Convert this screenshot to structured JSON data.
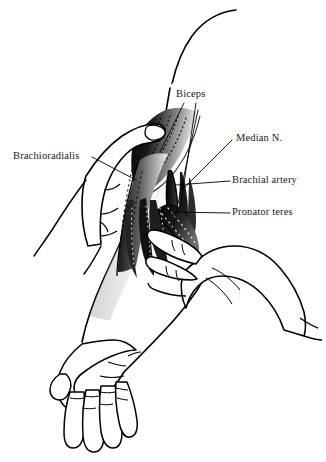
{
  "figure": {
    "kind": "anatomical-line-illustration",
    "background_color": "#ffffff",
    "ink_color": "#000000",
    "label_color": "#1a1a1a",
    "width": 326,
    "height": 462
  },
  "labels": [
    {
      "id": "brachioradialis",
      "text": "Brachioradialis",
      "side": "left",
      "x": 13,
      "y": 151,
      "leader": "from right edge of text diagonally down-right onto the brachioradialis muscle belly"
    },
    {
      "id": "biceps",
      "text": "Biceps",
      "side": "top",
      "x": 176,
      "y": 89,
      "leader": "two leader lines descending to the biceps tendon and muscle"
    },
    {
      "id": "median_n",
      "text": "Median N.",
      "side": "right",
      "x": 236,
      "y": 133,
      "leader": "from left of text diagonally down-left to the median nerve"
    },
    {
      "id": "brachial_artery",
      "text": "Brachial artery",
      "side": "right",
      "x": 232,
      "y": 175,
      "leader": "horizontal dash running left to the brachial artery"
    },
    {
      "id": "pronator_teres",
      "text": "Pronator teres",
      "side": "right",
      "x": 232,
      "y": 207,
      "leader": "horizontal dash running left to the pronator teres"
    }
  ],
  "structures": [
    {
      "name": "upper-arm-outline",
      "description": "long curved contour of the upper arm entering from the top of the frame"
    },
    {
      "name": "forearm-outline",
      "description": "forearm sweeping down and to the left toward the wrist"
    },
    {
      "name": "patient-hand",
      "description": "relaxed hand with four fingers and thumb at the lower left"
    },
    {
      "name": "biceps-muscle-belly",
      "description": "dark shaded biceps belly with stippled fascicle lines"
    },
    {
      "name": "biceps-tendon",
      "description": "narrow tendon descending into the cubital fossa"
    },
    {
      "name": "brachioradialis-muscle",
      "description": "shaded muscle mass lateral to the cubital fossa"
    },
    {
      "name": "pronator-teres-muscle",
      "description": "dark stippled muscle crossing obliquely below the fossa"
    },
    {
      "name": "median-nerve",
      "description": "fine cord medial to the brachial artery"
    },
    {
      "name": "brachial-artery",
      "description": "vessel in the cubital fossa between biceps tendon and median nerve"
    },
    {
      "name": "examiner-hand-upper",
      "description": "examiner's hand grasping the arm from the left, thumb over the muscle"
    },
    {
      "name": "examiner-hand-lower",
      "description": "examiner's second hand with fingers palpating the cubital fossa from the right"
    },
    {
      "name": "examiner-wrist-cuff",
      "description": "cuff line at the examiner's lower wrist on the right edge"
    }
  ]
}
